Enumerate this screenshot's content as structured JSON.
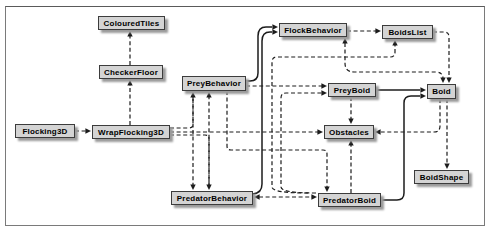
{
  "diagram": {
    "colors": {
      "background": "#ffffff",
      "frame_border": "#7a7a7a",
      "node_fill": "#d4d4d4",
      "node_border": "#3c3c3c",
      "node_shadow": "#9b9b9b",
      "line": "#1c1c1c",
      "text": "#000000"
    },
    "nodes": [
      {
        "id": "flocking3d",
        "label": "Flocking3D",
        "x": 15,
        "y": 124,
        "w": 60,
        "h": 14
      },
      {
        "id": "wrapflocking3d",
        "label": "WrapFlocking3D",
        "x": 92,
        "y": 125,
        "w": 78,
        "h": 14
      },
      {
        "id": "colouredtiles",
        "label": "ColouredTiles",
        "x": 98,
        "y": 16,
        "w": 67,
        "h": 14
      },
      {
        "id": "checkerfloor",
        "label": "CheckerFloor",
        "x": 99,
        "y": 65,
        "w": 64,
        "h": 14
      },
      {
        "id": "preybehavior",
        "label": "PreyBehavior",
        "x": 182,
        "y": 76,
        "w": 64,
        "h": 15
      },
      {
        "id": "flockbehavior",
        "label": "FlockBehavior",
        "x": 279,
        "y": 23,
        "w": 68,
        "h": 14
      },
      {
        "id": "boidslist",
        "label": "BoidsList",
        "x": 382,
        "y": 25,
        "w": 51,
        "h": 14
      },
      {
        "id": "preyboid",
        "label": "PreyBoid",
        "x": 328,
        "y": 83,
        "w": 48,
        "h": 14
      },
      {
        "id": "boid",
        "label": "Boid",
        "x": 427,
        "y": 84,
        "w": 29,
        "h": 15
      },
      {
        "id": "obstacles",
        "label": "Obstacles",
        "x": 324,
        "y": 125,
        "w": 50,
        "h": 14
      },
      {
        "id": "predatorbehavior",
        "label": "PredatorBehavior",
        "x": 171,
        "y": 191,
        "w": 82,
        "h": 14
      },
      {
        "id": "predatorboid",
        "label": "PredatorBoid",
        "x": 318,
        "y": 193,
        "w": 63,
        "h": 14
      },
      {
        "id": "boidshape",
        "label": "BoidShape",
        "x": 414,
        "y": 170,
        "w": 55,
        "h": 14
      }
    ],
    "edges": [
      {
        "id": "flocking3d-wrapflocking3d",
        "from": "flocking3d",
        "to": "wrapflocking3d",
        "style": "dashed",
        "d": "M75,131 H86",
        "arrows": [
          {
            "x": 91,
            "y": 131,
            "dir": "right"
          }
        ]
      },
      {
        "id": "wrapflocking3d-checkerfloor",
        "from": "wrapflocking3d",
        "to": "checkerfloor",
        "style": "dashed",
        "d": "M130,125 V85",
        "arrows": [
          {
            "x": 130,
            "y": 80,
            "dir": "up"
          }
        ]
      },
      {
        "id": "checkerfloor-colouredtiles",
        "from": "checkerfloor",
        "to": "colouredtiles",
        "style": "dashed",
        "d": "M130,65 V36",
        "arrows": [
          {
            "x": 130,
            "y": 31,
            "dir": "up"
          }
        ]
      },
      {
        "id": "wrapflocking3d-preybehavior",
        "from": "wrapflocking3d",
        "to": "preybehavior",
        "style": "dashed",
        "d": "M170,128 H189 Q193,128 193,124 V97",
        "arrows": [
          {
            "x": 193,
            "y": 92,
            "dir": "up"
          }
        ]
      },
      {
        "id": "wrapflocking3d-obstacles",
        "from": "wrapflocking3d",
        "to": "obstacles",
        "style": "dashed",
        "d": "M170,132 H318",
        "arrows": [
          {
            "x": 323,
            "y": 132,
            "dir": "right"
          }
        ]
      },
      {
        "id": "wrapflocking3d-predatorbehavior",
        "from": "wrapflocking3d",
        "to": "predatorbehavior",
        "style": "dashed",
        "d": "M170,135 H205 Q209,135 209,139 V185",
        "arrows": [
          {
            "x": 209,
            "y": 190,
            "dir": "down"
          }
        ]
      },
      {
        "id": "preybehavior-predatorbehavior",
        "from": "preybehavior",
        "to": "predatorbehavior",
        "style": "dashed",
        "d": "M193,97 V185",
        "arrows": [
          {
            "x": 193,
            "y": 190,
            "dir": "down"
          }
        ]
      },
      {
        "id": "predatorbehavior-preybehavior",
        "from": "predatorbehavior",
        "to": "preybehavior",
        "style": "dashed",
        "d": "M209,185 V97",
        "arrows": [
          {
            "x": 209,
            "y": 92,
            "dir": "up"
          }
        ]
      },
      {
        "id": "preybehavior-preyboid",
        "from": "preybehavior",
        "to": "preyboid",
        "style": "dashed",
        "d": "M246,86 H322",
        "arrows": [
          {
            "x": 327,
            "y": 86,
            "dir": "right"
          }
        ]
      },
      {
        "id": "preybehavior-predatorboid",
        "from": "preybehavior",
        "to": "predatorboid",
        "style": "dashed",
        "d": "M227,91 V146 Q227,150 231,150 H323 Q327,150 327,154 V187",
        "arrows": [
          {
            "x": 327,
            "y": 192,
            "dir": "down"
          }
        ]
      },
      {
        "id": "predatorbehavior-predatorboid",
        "from": "predatorbehavior",
        "to": "predatorboid",
        "style": "dashed",
        "d": "M259,197 H312",
        "arrows": [
          {
            "x": 254,
            "y": 197,
            "dir": "left"
          },
          {
            "x": 317,
            "y": 197,
            "dir": "right"
          }
        ]
      },
      {
        "id": "predatorboid-preyboid",
        "from": "predatorboid",
        "to": "preyboid",
        "style": "dashed",
        "d": "M316,193 Q281,193 281,187 V98 Q281,93 286,93 H322",
        "arrows": [
          {
            "x": 327,
            "y": 93,
            "dir": "right"
          }
        ]
      },
      {
        "id": "predatorboid-boidslist",
        "from": "predatorboid",
        "to": "boidslist",
        "style": "dashed",
        "d": "M308,193 Q272,193 272,187 V62 Q272,57 277,57 H390 Q395,57 395,52 V45",
        "arrows": [
          {
            "x": 395,
            "y": 40,
            "dir": "up"
          }
        ]
      },
      {
        "id": "flockbehavior-boidslist",
        "from": "flockbehavior",
        "to": "boidslist",
        "style": "dashed",
        "d": "M347,31 H376",
        "arrows": [
          {
            "x": 381,
            "y": 31,
            "dir": "right"
          }
        ]
      },
      {
        "id": "boidslist-boid",
        "from": "boidslist",
        "to": "boid",
        "style": "dashed",
        "d": "M433,32 H444 Q449,32 449,37 V78",
        "arrows": [
          {
            "x": 449,
            "y": 83,
            "dir": "down"
          }
        ]
      },
      {
        "id": "flockbehavior-boid-channel",
        "from": "flockbehavior",
        "to": "boid",
        "style": "dashed",
        "d": "M345,43 V63 Q345,72 354,72 H436 Q443,72 443,79 V79",
        "arrows": [
          {
            "x": 345,
            "y": 38,
            "dir": "up"
          },
          {
            "x": 443,
            "y": 83,
            "dir": "down"
          }
        ]
      },
      {
        "id": "boid-obstacles",
        "from": "boid",
        "to": "obstacles",
        "style": "dashed",
        "d": "M440,99 V126 Q440,132 434,132 H381",
        "arrows": [
          {
            "x": 375,
            "y": 132,
            "dir": "left"
          }
        ]
      },
      {
        "id": "boid-boidshape",
        "from": "boid",
        "to": "boidshape",
        "style": "dashed",
        "d": "M447,99 V164",
        "arrows": [
          {
            "x": 447,
            "y": 169,
            "dir": "down"
          }
        ]
      },
      {
        "id": "preyboid-obstacles",
        "from": "preyboid",
        "to": "obstacles",
        "style": "dashed",
        "d": "M351,97 V119",
        "arrows": [
          {
            "x": 351,
            "y": 124,
            "dir": "down"
          }
        ]
      },
      {
        "id": "predatorboid-obstacles",
        "from": "predatorboid",
        "to": "obstacles",
        "style": "dashed",
        "d": "M351,193 V145",
        "arrows": [
          {
            "x": 351,
            "y": 140,
            "dir": "up"
          }
        ]
      },
      {
        "id": "preybehavior-flockbehavior",
        "from": "preybehavior",
        "to": "flockbehavior",
        "style": "solid",
        "d": "M246,81 H250 Q258,81 258,73 V36 Q258,27 266,27 H272",
        "arrows": [
          {
            "x": 278,
            "y": 27,
            "dir": "right"
          }
        ]
      },
      {
        "id": "predatorbehavior-flockbehavior",
        "from": "predatorbehavior",
        "to": "flockbehavior",
        "style": "solid",
        "d": "M253,194 Q262,193 262,184 V41 Q262,32 270,32 H272",
        "arrows": [
          {
            "x": 278,
            "y": 32,
            "dir": "right"
          }
        ]
      },
      {
        "id": "preyboid-boid",
        "from": "preyboid",
        "to": "boid",
        "style": "solid",
        "d": "M376,90 H420",
        "arrows": [
          {
            "x": 426,
            "y": 90,
            "dir": "right"
          }
        ]
      },
      {
        "id": "predatorboid-boid",
        "from": "predatorboid",
        "to": "boid",
        "style": "solid",
        "d": "M381,200 H397 Q404,200 404,193 V103 Q404,96 411,96 H420",
        "arrows": [
          {
            "x": 426,
            "y": 96,
            "dir": "right"
          }
        ]
      }
    ]
  }
}
